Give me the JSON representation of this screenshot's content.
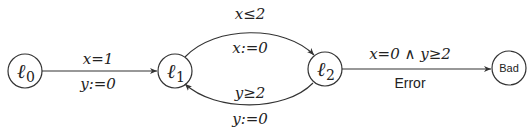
{
  "diagram": {
    "type": "timed-automaton",
    "colors": {
      "stroke": "#333333",
      "text": "#222222",
      "background": "#ffffff"
    },
    "nodes": [
      {
        "id": "l0",
        "label": "ℓ",
        "sub": "0"
      },
      {
        "id": "l1",
        "label": "ℓ",
        "sub": "1"
      },
      {
        "id": "l2",
        "label": "ℓ",
        "sub": "2"
      },
      {
        "id": "bad",
        "label": "Bad"
      }
    ],
    "edges": [
      {
        "from": "l0",
        "to": "l1",
        "guard": "x=1",
        "reset": "y:=0"
      },
      {
        "from": "l1",
        "to": "l2",
        "guard": "x≤2",
        "reset": "x:=0"
      },
      {
        "from": "l2",
        "to": "l1",
        "guard": "y≥2",
        "reset": "y:=0"
      },
      {
        "from": "l2",
        "to": "bad",
        "guard": "x=0 ∧ y≥2",
        "label": "Error"
      }
    ]
  }
}
